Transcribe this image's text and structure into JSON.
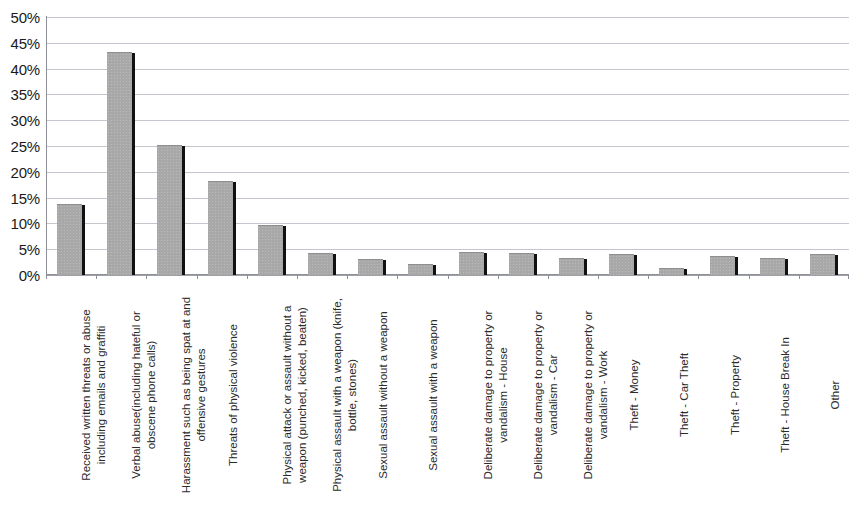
{
  "chart_data": {
    "type": "bar",
    "title": "",
    "xlabel": "",
    "ylabel": "",
    "ylim": [
      0,
      50
    ],
    "ytick_labels": [
      "50%",
      "45%",
      "40%",
      "35%",
      "30%",
      "25%",
      "20%",
      "15%",
      "10%",
      "5%",
      "0%"
    ],
    "ytick_values": [
      50,
      45,
      40,
      35,
      30,
      25,
      20,
      15,
      10,
      5,
      0
    ],
    "grid": true,
    "legend": false,
    "bar_color": "#a8a8a8",
    "shadow_color": "#111111",
    "gridline_color": "#b9bcc4",
    "categories": [
      "Received written threats or abuse including emails and graffiti",
      "Verbal abuse(including hateful or obscene phone calls)",
      "Harassment such as being spat at and offensive gestures",
      "Threats of physical violence",
      "Physical attack or assault without a weapon (punched, kicked, beaten)",
      "Physical assault with a weapon (knife, bottle, stones)",
      "Sexual assault without a weapon",
      "Sexual assault with a weapon",
      "Deliberate damage to property or vandalism - House",
      "Deliberate damage to property or vandalism - Car",
      "Deliberate damage to property or vandalism - Work",
      "Theft - Money",
      "Theft - Car Theft",
      "Theft - Property",
      "Theft - House Break In",
      "Other"
    ],
    "category_lines": [
      [
        "Received written threats or abuse",
        "including emails and graffiti"
      ],
      [
        "Verbal abuse(including hateful or",
        "obscene phone calls)"
      ],
      [
        "Harassment such as being spat at and",
        "offensive gestures"
      ],
      [
        "Threats of physical violence"
      ],
      [
        "Physical attack or assault without a",
        "weapon (punched, kicked, beaten)"
      ],
      [
        "Physical assault with a weapon (knife,",
        "bottle, stones)"
      ],
      [
        "Sexual assault without a weapon"
      ],
      [
        "Sexual assault with a weapon"
      ],
      [
        "Deliberate damage to property or",
        "vandalism - House"
      ],
      [
        "Deliberate damage to property or",
        "vandalism - Car"
      ],
      [
        "Deliberate damage to property or",
        "vandalism - Work"
      ],
      [
        "Theft - Money"
      ],
      [
        "Theft - Car Theft"
      ],
      [
        "Theft - Property"
      ],
      [
        "Theft - House Break In"
      ],
      [
        "Other"
      ]
    ],
    "values": [
      13.5,
      43,
      25,
      18,
      9.5,
      4,
      3,
      2,
      4.2,
      4,
      3.2,
      3.8,
      1.2,
      3.5,
      3.2,
      3.9
    ]
  }
}
